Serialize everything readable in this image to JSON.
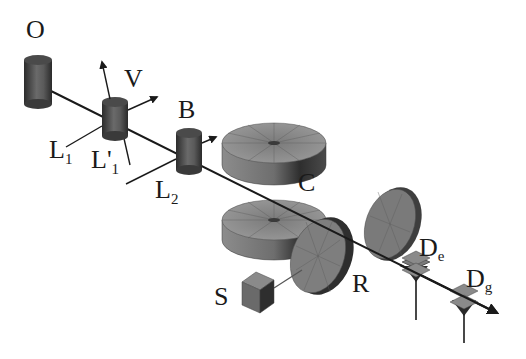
{
  "diagram": {
    "type": "schematic apparatus diagram (atomic beam setup)",
    "background": "#ffffff",
    "colors": {
      "ink": "#1a1a1a",
      "dark_gray": "#3a3a3a",
      "mid_gray": "#7a7a7a",
      "light_gray": "#a8a8a8"
    },
    "labels": {
      "O": "O",
      "V": "V",
      "B": "B",
      "L1": "L",
      "L1_sub": "1",
      "L1p": "L'",
      "L1p_sub": "1",
      "L2": "L",
      "L2_sub": "2",
      "C": "C",
      "S": "S",
      "R": "R",
      "De": "D",
      "De_sub": "e",
      "Dg": "D",
      "Dg_sub": "g"
    },
    "components": [
      {
        "id": "O",
        "shape": "cylinder",
        "description": "oven / source"
      },
      {
        "id": "V",
        "shape": "cylinder",
        "description": "velocity selection region with arrows"
      },
      {
        "id": "B",
        "shape": "cylinder",
        "description": "beam element with arrow"
      },
      {
        "id": "C",
        "shape": "disk",
        "description": "cavity mirror (upper)"
      },
      {
        "id": "C2",
        "shape": "disk",
        "description": "cavity mirror (lower)"
      },
      {
        "id": "R",
        "shape": "disk",
        "description": "rotated disk"
      },
      {
        "id": "S",
        "shape": "cube",
        "description": "source connected to R"
      },
      {
        "id": "De",
        "shape": "detector plates",
        "description": "excited-state detector"
      },
      {
        "id": "Dg",
        "shape": "detector plates",
        "description": "ground-state detector"
      }
    ],
    "beam_lines": [
      "O→V→B→C→De→Dg (arrow)",
      "L1",
      "L'1",
      "L2",
      "S–R"
    ]
  }
}
